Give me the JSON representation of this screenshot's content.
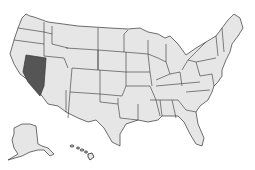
{
  "map": {
    "title": "United States",
    "highlighted_state": "Nevada",
    "colors": {
      "base_fill": "#e6e6e6",
      "highlight_fill": "#555555",
      "border": "#333333",
      "background": "#ffffff"
    },
    "insets": [
      "Alaska",
      "Hawaii"
    ]
  }
}
